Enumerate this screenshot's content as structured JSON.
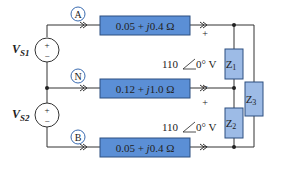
{
  "sources": [
    {
      "name": "V",
      "sub": "S1",
      "plus": "+",
      "minus": "−"
    },
    {
      "name": "V",
      "sub": "S2",
      "plus": "+",
      "minus": "−"
    }
  ],
  "nodes": [
    "A",
    "N",
    "B"
  ],
  "lines": [
    {
      "impedance": "0.05 + j0.4 Ω",
      "real": "0.05 + ",
      "j": "j",
      "imag": "0.4 Ω"
    },
    {
      "impedance": "0.12 + j1.0 Ω",
      "real": "0.12 + ",
      "j": "j",
      "imag": "1.0 Ω"
    },
    {
      "impedance": "0.05 + j0.4 Ω",
      "real": "0.05 + ",
      "j": "j",
      "imag": "0.4 Ω"
    }
  ],
  "loads": [
    {
      "name": "Z",
      "sub": "1"
    },
    {
      "name": "Z",
      "sub": "2"
    },
    {
      "name": "Z",
      "sub": "3"
    }
  ],
  "voltages": [
    {
      "mag": "110",
      "angle": "0°",
      "unit": "V",
      "plus": "+",
      "minus": "−"
    },
    {
      "mag": "110",
      "angle": "0°",
      "unit": "V",
      "plus": "+",
      "minus": "−"
    }
  ],
  "colors": {
    "line_box": "#5b8fd6",
    "load_box": "#9dbbe6",
    "node_circle": "#3a6bb0",
    "wire": "#333333"
  }
}
